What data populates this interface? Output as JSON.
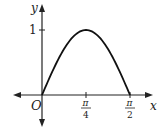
{
  "chart_data": {
    "type": "line",
    "title": "",
    "xlabel": "x",
    "ylabel": "y",
    "origin_label": "O",
    "function": "y = sin(2x)",
    "x": [
      0,
      0.19635,
      0.392699,
      0.589049,
      0.785398,
      0.981748,
      1.178097,
      1.374447,
      1.570796
    ],
    "y": [
      0,
      0.3827,
      0.7071,
      0.9239,
      1.0,
      0.9239,
      0.7071,
      0.3827,
      0
    ],
    "xticks": [
      {
        "value": 0.785398,
        "num": "π",
        "den": "4"
      },
      {
        "value": 1.570796,
        "num": "π",
        "den": "2"
      }
    ],
    "yticks": [
      {
        "value": 1,
        "label": "1"
      }
    ],
    "xlim": [
      -0.7,
      1.9
    ],
    "ylim": [
      -0.45,
      1.4
    ],
    "grid": false,
    "legend": null,
    "line_color": "#111111",
    "axis_color": "#222222"
  }
}
